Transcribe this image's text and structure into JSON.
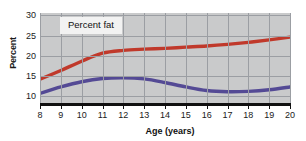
{
  "chart_data": {
    "type": "line",
    "title": "",
    "annotation": "Percent fat",
    "xlabel": "Age (years)",
    "ylabel": "Percent",
    "xlim": [
      8,
      20
    ],
    "ylim": [
      8.2,
      30.6
    ],
    "xticks": [
      8,
      9,
      10,
      11,
      12,
      13,
      14,
      15,
      16,
      17,
      18,
      19,
      20
    ],
    "yticks": [
      10,
      15,
      20,
      25,
      30
    ],
    "grid": true,
    "legend_position": "none",
    "plot_background": "#c9cacb",
    "gridline_color": "#9b9ea3",
    "x": [
      8,
      9,
      10,
      11,
      12,
      13,
      14,
      15,
      16,
      17,
      18,
      19,
      20
    ],
    "series": [
      {
        "name": "Girls",
        "color": "#c0392b",
        "values": [
          14.1,
          16.3,
          18.6,
          20.6,
          21.3,
          21.6,
          21.8,
          22.1,
          22.4,
          22.8,
          23.3,
          23.9,
          24.6
        ]
      },
      {
        "name": "Boys",
        "color": "#544a95",
        "values": [
          10.6,
          12.2,
          13.5,
          14.3,
          14.5,
          14.2,
          13.3,
          12.2,
          11.3,
          11.0,
          11.1,
          11.5,
          12.2
        ]
      }
    ]
  },
  "axis": {
    "y_title": "Percent",
    "x_title": "Age (years)",
    "y_tick_labels": [
      "30",
      "25",
      "20",
      "15",
      "10"
    ],
    "x_tick_labels": [
      "8",
      "9",
      "10",
      "11",
      "12",
      "13",
      "14",
      "15",
      "16",
      "17",
      "18",
      "19",
      "20"
    ]
  }
}
